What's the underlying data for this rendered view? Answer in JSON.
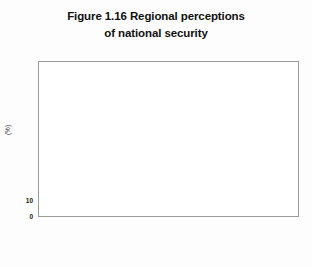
{
  "figure": {
    "title_lines": [
      "Figure 1.16 Regional perceptions",
      "of national security"
    ]
  },
  "legend": {
    "position": "top-right",
    "items": [
      {
        "label": "Poor",
        "color": "#141414",
        "swatch_name": "legend-swatch-poor"
      },
      {
        "label": "Good",
        "color": "#b3b3b3",
        "swatch_name": "legend-swatch-good"
      }
    ]
  },
  "axes": {
    "y_label": "(%)",
    "y_ticks": [
      "0",
      "10",
      "20",
      "30",
      "40",
      "50",
      "60",
      "70",
      "80",
      "90",
      "100"
    ],
    "y_min": 0,
    "y_max": 100
  },
  "chart_data": {
    "type": "bar",
    "title": "Figure 1.16 Regional perceptions of national security",
    "xlabel": "",
    "ylabel": "(%)",
    "ylim": [
      0,
      100
    ],
    "grid": true,
    "legend_position": "top-right",
    "categories": [
      "Pacific",
      "West\nAsia",
      "Middle\nEast",
      "South\nAmerica",
      "North\nAmerica",
      "Africa",
      "East/\nCentral\nEurope",
      "West\nEurope",
      "Total\nSample"
    ],
    "series": [
      {
        "name": "Poor",
        "color": "#141414",
        "values": [
          45,
          30,
          28,
          69,
          26,
          55,
          37,
          27,
          36
        ]
      },
      {
        "name": "Good",
        "color": "#b3b3b3",
        "values": [
          15,
          39,
          29,
          6,
          38,
          23,
          23,
          32,
          28
        ]
      }
    ]
  }
}
